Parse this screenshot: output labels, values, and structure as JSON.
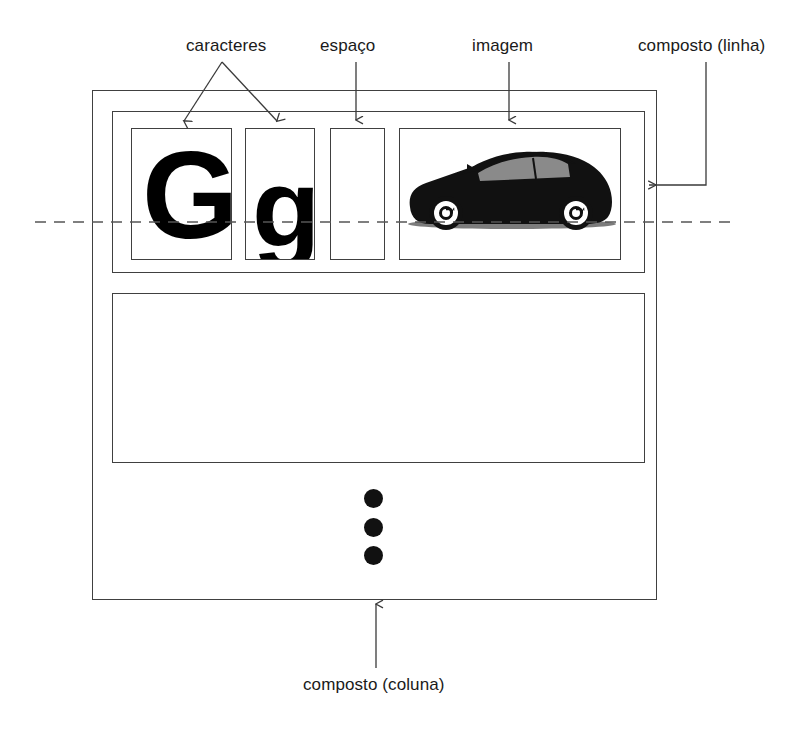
{
  "diagram": {
    "language": "pt-BR",
    "background_color": "#ffffff",
    "line_color": "#404040",
    "text_color": "#1a1a1a"
  },
  "labels": {
    "caracteres": "caracteres",
    "espaco": "espaço",
    "imagem": "imagem",
    "composto_linha": "composto (linha)",
    "composto_coluna": "composto (coluna)"
  },
  "cells": [
    {
      "id": "cell-char-uppercase",
      "type": "character",
      "glyph": "G",
      "label": "caracteres"
    },
    {
      "id": "cell-char-lowercase",
      "type": "character",
      "glyph": "g",
      "label": "caracteres"
    },
    {
      "id": "cell-space",
      "type": "space",
      "glyph": "",
      "label": "espaço"
    },
    {
      "id": "cell-image",
      "type": "image",
      "glyph": "",
      "label": "imagem",
      "icon": "car-silhouette-icon"
    }
  ],
  "rows": [
    {
      "id": "row-1",
      "name": "composto (linha)",
      "populated": true
    },
    {
      "id": "row-2",
      "name": "composto (linha)",
      "populated": false
    }
  ],
  "column": {
    "id": "column-1",
    "name": "composto (coluna)"
  },
  "ellipsis": {
    "symbol": "vertical-ellipsis",
    "count": 3
  },
  "baseline": {
    "name": "linha de base",
    "style": "dashed"
  }
}
